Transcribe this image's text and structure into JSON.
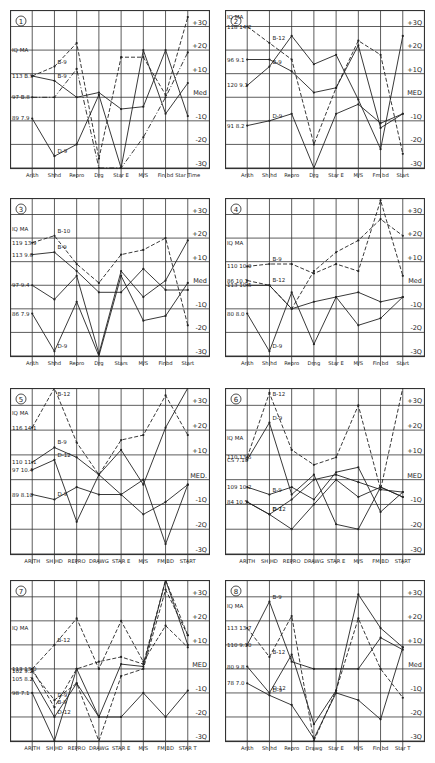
{
  "figure": {
    "layout": {
      "columns": 2,
      "rows": 4
    },
    "colors": {
      "ink": "#222222",
      "grid": "#333333",
      "paper": "#ffffff"
    }
  },
  "chart_data": [
    {
      "type": "line",
      "panel_number": "1",
      "categories": [
        "Arith",
        "Shhd",
        "Repro",
        "Drg",
        "Star E",
        "M/S",
        "Fin bd",
        "Star Time"
      ],
      "y_ticks": [
        "+3Q",
        "+2Q",
        "+1Q",
        "Med",
        "-1Q",
        "-2Q",
        "-3Q"
      ],
      "ylim": [
        -3,
        3.7
      ],
      "left_labels": [
        {
          "text": "IQ  MA",
          "y": 2.0
        },
        {
          "text": "113  B.9",
          "y": 0.9
        },
        {
          "text": "97  B.8",
          "y": 0.0
        },
        {
          "text": "89  7.9",
          "y": -0.9
        }
      ],
      "series": [
        {
          "name": "B-9 dashed",
          "style": "dashed",
          "values": [
            0.9,
            1.3,
            2.3,
            -2.6,
            1.7,
            1.7,
            0.1,
            3.4
          ]
        },
        {
          "name": "B-9",
          "style": "solid",
          "values": [
            0.9,
            0.7,
            0.0,
            0.2,
            -0.5,
            -0.4,
            2.0,
            -0.8
          ]
        },
        {
          "name": "D-9",
          "style": "solid",
          "values": [
            -0.9,
            -2.5,
            -2.0,
            0.1,
            -3.0,
            2.0,
            -0.7,
            0.6
          ]
        },
        {
          "name": "x-series",
          "style": "dashdot",
          "values": [
            0.0,
            0.0,
            1.2,
            -3.0,
            -3.0,
            -1.7,
            0.0,
            1.9
          ]
        }
      ],
      "annotations": [
        "B-9",
        "D-9",
        "B-9",
        "D-9"
      ]
    },
    {
      "type": "line",
      "panel_number": "2",
      "categories": [
        "Arith",
        "Sh hd",
        "Repro",
        "Drg",
        "Star E",
        "M/S",
        "Fm bd",
        "Start"
      ],
      "y_ticks": [
        "+3Q",
        "+2Q",
        "+1Q",
        "MED",
        "-1Q",
        "-2Q",
        "-3Q"
      ],
      "ylim": [
        -3,
        3.7
      ],
      "left_labels": [
        {
          "text": "IQ  MA",
          "y": 3.4
        },
        {
          "text": "118  14.2",
          "y": 3.0
        },
        {
          "text": "96  9.1",
          "y": 1.6
        },
        {
          "text": "120  9.1",
          "y": 0.5
        },
        {
          "text": "91  8.2",
          "y": -1.2
        }
      ],
      "series": [
        {
          "name": "B-12",
          "style": "dashed",
          "values": [
            3.0,
            2.3,
            1.6,
            -2.0,
            0.4,
            2.4,
            1.8,
            -2.4
          ]
        },
        {
          "name": "B-9",
          "style": "solid",
          "values": [
            0.5,
            1.3,
            2.6,
            1.4,
            1.8,
            -0.1,
            -2.2,
            2.6
          ]
        },
        {
          "name": "x-series",
          "style": "solid",
          "values": [
            1.6,
            1.6,
            1.1,
            0.2,
            0.4,
            2.2,
            -1.3,
            -0.7
          ]
        },
        {
          "name": "D-9",
          "style": "solid",
          "values": [
            -1.2,
            -1.0,
            -0.7,
            -3.4,
            -0.7,
            -0.3,
            -1.1,
            -0.7
          ]
        }
      ],
      "annotations": [
        "D-9",
        "B-12",
        "B-9",
        "D-9"
      ]
    },
    {
      "type": "line",
      "panel_number": "3",
      "categories": [
        "Arith",
        "Shhd",
        "Repro",
        "Drg",
        "Stars",
        "M/S",
        "Finbd",
        "Start"
      ],
      "y_ticks": [
        "+3Q",
        "+2Q",
        "+1Q",
        "Med",
        "-1Q",
        "-2Q",
        "-3Q"
      ],
      "ylim": [
        -3,
        3.7
      ],
      "left_labels": [
        {
          "text": "IQ  MA",
          "y": 2.4
        },
        {
          "text": "119  13.9",
          "y": 1.8
        },
        {
          "text": "113  9.6",
          "y": 1.3
        },
        {
          "text": "97  9.4",
          "y": 0.0
        },
        {
          "text": "86  7.9",
          "y": -1.2
        }
      ],
      "series": [
        {
          "name": "B-10 dashed",
          "style": "dashed",
          "values": [
            1.8,
            2.1,
            0.9,
            0.1,
            1.3,
            1.5,
            2.0,
            -1.7
          ]
        },
        {
          "name": "B-9",
          "style": "solid",
          "values": [
            1.3,
            1.4,
            0.6,
            -0.3,
            -0.3,
            0.7,
            -0.2,
            -0.2
          ]
        },
        {
          "name": "x-series",
          "style": "solid",
          "values": [
            0.0,
            -0.6,
            0.4,
            -2.9,
            0.6,
            -0.5,
            0.2,
            1.9
          ]
        },
        {
          "name": "D-9",
          "style": "solid",
          "values": [
            -1.2,
            -2.8,
            -0.7,
            -3.4,
            0.4,
            -1.5,
            -1.3,
            0.1
          ]
        }
      ],
      "annotations": [
        "B-10",
        "B-9",
        "B-9",
        "D-9"
      ]
    },
    {
      "type": "line",
      "panel_number": "4",
      "categories": [
        "Arith",
        "Sh hd",
        "Repro",
        "Drng",
        "Star E",
        "M/S",
        "Fin bd",
        "Start"
      ],
      "y_ticks": [
        "+3Q",
        "+2Q",
        "+1Q",
        "Med",
        "-1Q",
        "-2Q",
        "-3Q"
      ],
      "ylim": [
        -3,
        3.7
      ],
      "left_labels": [
        {
          "text": "IQ  MA",
          "y": 1.8
        },
        {
          "text": "110  10.0",
          "y": 0.8
        },
        {
          "text": "86  10.1",
          "y": 0.2
        },
        {
          "text": "113  10.5",
          "y": 0.0
        },
        {
          "text": "80  8.0",
          "y": -1.2
        }
      ],
      "series": [
        {
          "name": "B-9",
          "style": "dashed",
          "values": [
            0.8,
            0.9,
            0.9,
            0.5,
            0.9,
            0.6,
            3.6,
            0.4
          ]
        },
        {
          "name": "B-12",
          "style": "dashed",
          "values": [
            0.2,
            0.0,
            -1.0,
            0.6,
            1.4,
            1.9,
            2.8,
            2.1
          ]
        },
        {
          "name": "x-series",
          "style": "solid",
          "values": [
            0.0,
            0.0,
            -1.0,
            -0.7,
            -0.5,
            -0.3,
            -0.7,
            -0.5
          ]
        },
        {
          "name": "D-9",
          "style": "solid",
          "values": [
            -1.2,
            -2.8,
            -0.3,
            -2.5,
            -0.5,
            -1.7,
            -1.4,
            -0.5
          ]
        }
      ],
      "annotations": [
        "B-9",
        "B-12",
        "D-9",
        "D-9"
      ]
    },
    {
      "type": "line",
      "panel_number": "5",
      "categories": [
        "ARITH",
        "SH HD",
        "REPRO",
        "DRAWG",
        "STAR E",
        "M/S",
        "FM BD",
        "START"
      ],
      "y_ticks": [
        "+3Q",
        "+2Q",
        "+1Q",
        "MED.",
        "-1Q",
        "-2Q",
        "-3Q"
      ],
      "ylim": [
        -3,
        3.7
      ],
      "left_labels": [
        {
          "text": "IQ  MA",
          "y": 2.7
        },
        {
          "text": "116  14.1",
          "y": 2.1
        },
        {
          "text": "110  11.1",
          "y": 0.7
        },
        {
          "text": "97  10.4",
          "y": 0.4
        },
        {
          "text": "89  8.10",
          "y": -0.6
        }
      ],
      "series": [
        {
          "name": "B-12",
          "style": "dashed",
          "values": [
            2.1,
            4.0,
            1.5,
            0.2,
            1.6,
            1.8,
            3.4,
            1.8
          ]
        },
        {
          "name": "B-9",
          "style": "solid",
          "values": [
            0.7,
            1.3,
            0.9,
            0.2,
            1.2,
            -0.2,
            2.1,
            3.8
          ]
        },
        {
          "name": "D-12",
          "style": "solid",
          "values": [
            0.4,
            0.8,
            -1.7,
            0.2,
            -0.6,
            -1.4,
            -0.9,
            -0.2
          ]
        },
        {
          "name": "D-9",
          "style": "solid",
          "values": [
            -0.6,
            -0.8,
            -0.3,
            -0.6,
            -0.6,
            0.0,
            -2.6,
            -0.2
          ]
        }
      ],
      "annotations": [
        "B-12",
        "B-9",
        "D-12",
        "D-9"
      ]
    },
    {
      "type": "line",
      "panel_number": "6",
      "categories": [
        "ARITH",
        "SH HD",
        "REPRO",
        "DRAWG",
        "STAR E",
        "M/S",
        "FM BD",
        "START"
      ],
      "y_ticks": [
        "+3Q",
        "+2Q",
        "+1Q",
        "MED",
        "-1Q",
        "-2Q",
        "-3Q"
      ],
      "ylim": [
        -3,
        3.7
      ],
      "left_labels": [
        {
          "text": "IQ  MA",
          "y": 1.7
        },
        {
          "text": "110  13.5",
          "y": 0.9
        },
        {
          "text": "CS  7.10",
          "y": 0.8
        },
        {
          "text": "109  10.2",
          "y": -0.3
        },
        {
          "text": "84  10.5",
          "y": -0.9
        }
      ],
      "series": [
        {
          "name": "B-12",
          "style": "dashed",
          "values": [
            0.9,
            3.5,
            1.2,
            0.6,
            0.9,
            3.0,
            -0.4,
            3.8
          ]
        },
        {
          "name": "D-9",
          "style": "solid",
          "values": [
            0.8,
            2.3,
            -0.6,
            0.2,
            -1.8,
            -2.0,
            -0.3,
            -0.7
          ]
        },
        {
          "name": "B-9",
          "style": "solid",
          "values": [
            -0.3,
            -0.6,
            -0.3,
            -0.8,
            0.3,
            0.5,
            -1.3,
            -0.5
          ]
        },
        {
          "name": "D-12",
          "style": "solid",
          "values": [
            -0.9,
            -1.4,
            -0.8,
            0.0,
            0.2,
            -0.1,
            -0.4,
            -0.5
          ]
        },
        {
          "name": "B-7",
          "style": "solid",
          "values": [
            -0.9,
            -1.4,
            -2.0,
            -1.0,
            0.0,
            -0.7,
            -0.3,
            -0.7
          ]
        }
      ],
      "annotations": [
        "B-12",
        "D-9",
        "D-12",
        "B-7",
        "D-9",
        "B-12"
      ]
    },
    {
      "type": "line",
      "panel_number": "7",
      "categories": [
        "ARITH",
        "SH HD",
        "REPRO",
        "DRAWG",
        "STAR E",
        "M/S",
        "FM BD",
        "STAR T"
      ],
      "y_ticks": [
        "+3Q",
        "+2Q",
        "+1Q",
        "MED",
        "-1Q",
        "-2Q",
        "-3Q"
      ],
      "ylim": [
        -3,
        3.7
      ],
      "left_labels": [
        {
          "text": "IQ  MA",
          "y": 1.7
        },
        {
          "text": "113  13.0",
          "y": 0.0
        },
        {
          "text": "102  9.2",
          "y": -0.1
        },
        {
          "text": "105  8.2",
          "y": -0.4
        },
        {
          "text": "98  7.1",
          "y": -1.0
        }
      ],
      "series": [
        {
          "name": "B-12",
          "style": "dashed",
          "values": [
            0.0,
            1.0,
            2.1,
            0.0,
            2.0,
            0.3,
            1.8,
            0.9
          ]
        },
        {
          "name": "B-9",
          "style": "dashed",
          "values": [
            0.0,
            -1.6,
            0.0,
            0.3,
            0.5,
            0.2,
            3.9,
            1.4
          ]
        },
        {
          "name": "D-9",
          "style": "dashed",
          "values": [
            -0.1,
            -1.3,
            -0.6,
            -3.2,
            -0.3,
            0.0,
            3.3,
            1.4
          ]
        },
        {
          "name": "D-12",
          "style": "solid",
          "values": [
            -0.4,
            -2.0,
            -0.6,
            -2.0,
            0.2,
            0.1,
            3.9,
            1.0
          ]
        },
        {
          "name": "x-series",
          "style": "solid",
          "values": [
            -1.0,
            -3.0,
            0.0,
            -2.0,
            -2.0,
            -1.0,
            -2.0,
            -0.9
          ]
        }
      ],
      "annotations": [
        "B-12",
        "D-9",
        "B-9",
        "D-12"
      ]
    },
    {
      "type": "line",
      "panel_number": "8",
      "categories": [
        "Arith",
        "Sh hd",
        "Repro",
        "Drawg",
        "Star E",
        "M/S",
        "Fin bd",
        "Star T"
      ],
      "y_ticks": [
        "+3Q",
        "+2Q",
        "+1Q",
        "Med",
        "-1Q",
        "-2Q",
        "-3Q"
      ],
      "ylim": [
        -3,
        3.7
      ],
      "left_labels": [
        {
          "text": "IQ  MA",
          "y": 2.6
        },
        {
          "text": "113  13.7",
          "y": 1.7
        },
        {
          "text": "110  9.10",
          "y": 1.0
        },
        {
          "text": "80  9.8",
          "y": 0.1
        },
        {
          "text": "78  7.0",
          "y": -0.6
        }
      ],
      "series": [
        {
          "name": "B-9",
          "style": "solid",
          "values": [
            1.0,
            2.8,
            0.3,
            0.0,
            0.0,
            0.0,
            1.3,
            0.8
          ]
        },
        {
          "name": "B-12",
          "style": "dashed",
          "values": [
            1.7,
            0.5,
            2.2,
            -3.0,
            -0.9,
            2.1,
            0.0,
            -1.2
          ]
        },
        {
          "name": "D-12",
          "style": "solid",
          "values": [
            0.1,
            -1.0,
            0.6,
            -2.3,
            -0.9,
            3.1,
            1.7,
            0.9
          ]
        },
        {
          "name": "D-9",
          "style": "solid",
          "values": [
            -0.6,
            -1.1,
            -1.5,
            -2.9,
            -1.0,
            -1.3,
            -2.1,
            0.9
          ]
        }
      ],
      "annotations": [
        "B-9",
        "B-12",
        "D-12",
        "D-9"
      ]
    }
  ]
}
